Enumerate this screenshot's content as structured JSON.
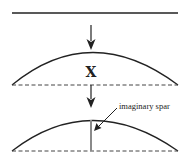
{
  "diagram": {
    "stage1": {
      "description": "flat line"
    },
    "stage2": {
      "label": "X",
      "description": "arched line over dashed baseline"
    },
    "stage3": {
      "callout": "imaginary spar",
      "description": "arched line with vertical spar"
    }
  },
  "colors": {
    "stroke": "#222222",
    "spar": "#8a8a8a"
  }
}
